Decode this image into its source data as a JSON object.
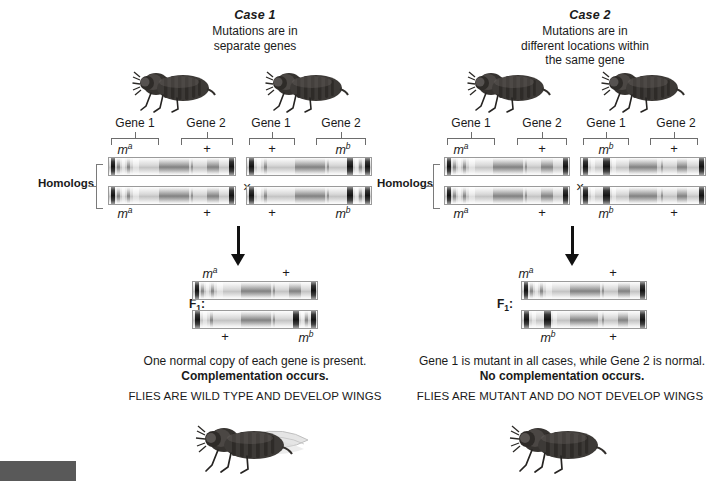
{
  "figure": {
    "title_case1": "Case 1",
    "title_case2": "Case 2",
    "subtitle_case1": "Mutations are in\nseparate genes",
    "subtitle_case2": "Mutations are in\ndifferent locations within\nthe same gene",
    "homologs_label": "Homologs",
    "cross_symbol": "×",
    "f1_label": "F1:",
    "gene1_label": "Gene 1",
    "gene2_label": "Gene 2",
    "allele_mutant_a": "ma",
    "allele_mutant_b": "mb",
    "allele_wildtype": "+",
    "superscript_a": "a",
    "superscript_b": "b",
    "base_m": "m"
  },
  "case1": {
    "title": "Case 1",
    "subtitle_line1": "Mutations are in",
    "subtitle_line2": "separate genes",
    "parent_left": {
      "gene1_label": "Gene 1",
      "gene2_label": "Gene 2",
      "top_left_allele": "ma",
      "top_right_allele": "+",
      "bottom_left_allele": "ma",
      "bottom_right_allele": "+"
    },
    "parent_right": {
      "gene1_label": "Gene 1",
      "gene2_label": "Gene 2",
      "top_left_allele": "+",
      "top_right_allele": "mb",
      "bottom_left_allele": "+",
      "bottom_right_allele": "mb"
    },
    "f1": {
      "label": "F1:",
      "top_left_allele": "ma",
      "top_right_allele": "+",
      "bottom_left_allele": "+",
      "bottom_right_allele": "mb"
    },
    "conclusion_line1": "One normal copy of each gene is present.",
    "conclusion_line2": "Complementation occurs.",
    "outcome": "FLIES ARE WILD TYPE AND DEVELOP WINGS",
    "offspring_has_wings": true,
    "parents_have_wings": false
  },
  "case2": {
    "title": "Case 2",
    "subtitle_line1": "Mutations are in",
    "subtitle_line2": "different locations within",
    "subtitle_line3": "the same gene",
    "parent_left": {
      "gene1_label": "Gene 1",
      "gene2_label": "Gene 2",
      "top_left_allele": "ma",
      "top_right_allele": "+",
      "bottom_left_allele": "ma",
      "bottom_right_allele": "+"
    },
    "parent_right": {
      "gene1_label": "Gene 1",
      "gene2_label": "Gene 2",
      "top_left_allele": "mb",
      "top_right_allele": "+",
      "bottom_left_allele": "mb",
      "bottom_right_allele": "+"
    },
    "f1": {
      "label": "F1:",
      "top_left_allele": "ma",
      "top_right_allele": "+",
      "bottom_left_allele": "mb",
      "bottom_right_allele": "+"
    },
    "conclusion_line1": "Gene 1 is mutant in all cases, while Gene 2 is normal.",
    "conclusion_line2": "No complementation occurs.",
    "outcome": "FLIES ARE MUTANT AND DO NOT DEVELOP WINGS",
    "offspring_has_wings": false,
    "parents_have_wings": false
  },
  "colors": {
    "text": "#1a1a1a",
    "chromosome_outline": "#9a9a9a",
    "chromosome_body": "#d9d9d9",
    "mutation_band": "#141414",
    "bracket": "#6d6d6d",
    "arrow": "#111111",
    "footer_swatch": "#595959",
    "fly_body": "#3a3a3a"
  }
}
